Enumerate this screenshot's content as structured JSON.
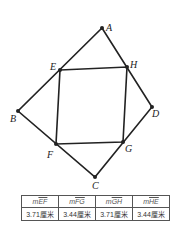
{
  "figure": {
    "points": {
      "A": {
        "label": "A",
        "x": 102,
        "y": 28
      },
      "B": {
        "label": "B",
        "x": 18,
        "y": 111
      },
      "C": {
        "label": "C",
        "x": 95,
        "y": 177
      },
      "D": {
        "label": "D",
        "x": 152,
        "y": 107
      },
      "E": {
        "label": "E",
        "x": 60,
        "y": 70
      },
      "F": {
        "label": "F",
        "x": 56,
        "y": 144
      },
      "G": {
        "label": "G",
        "x": 123,
        "y": 142
      },
      "H": {
        "label": "H",
        "x": 127,
        "y": 67
      }
    },
    "line_color": "#222222"
  },
  "measurements": {
    "headers": [
      {
        "prefix": "m",
        "segment": "EF"
      },
      {
        "prefix": "m",
        "segment": "FG"
      },
      {
        "prefix": "m",
        "segment": "GH"
      },
      {
        "prefix": "m",
        "segment": "HE"
      }
    ],
    "values": [
      "3.71厘米",
      "3.44厘米",
      "3.71厘米",
      "3.44厘米"
    ]
  }
}
